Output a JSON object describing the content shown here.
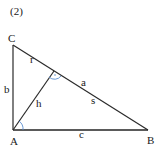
{
  "figure": {
    "tag": "(2)",
    "vertices": {
      "C": {
        "label": "C",
        "x": 13,
        "y": 45
      },
      "A": {
        "label": "A",
        "x": 13,
        "y": 130
      },
      "B": {
        "label": "B",
        "x": 148,
        "y": 130
      },
      "H": {
        "label": "",
        "x": 54,
        "y": 68
      }
    },
    "segment_labels": {
      "b": "b",
      "h": "h",
      "r": "r",
      "a": "a",
      "s": "s",
      "c": "c"
    },
    "colors": {
      "line": "#2a2a2a",
      "base_line": "#5a5a5a",
      "angle_arc": "#5b8fd0",
      "text": "#1a1a1a"
    }
  }
}
